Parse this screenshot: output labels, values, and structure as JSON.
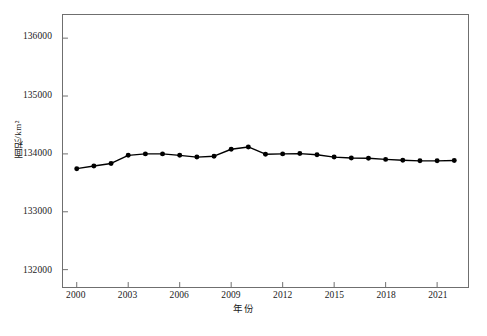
{
  "chart_data": {
    "type": "line",
    "title": "",
    "subtitle": "",
    "xlabel": "年份",
    "ylabel": "面积/km²",
    "xlim": [
      1999.2,
      2022.8
    ],
    "ylim": [
      131700,
      136400
    ],
    "grid": false,
    "legend": "none",
    "marker": "filled-circle",
    "line_color": "#000000",
    "marker_color": "#000000",
    "x_ticks": [
      2000,
      2003,
      2006,
      2009,
      2012,
      2015,
      2018,
      2021
    ],
    "x_tick_labels": [
      "2000",
      "2003",
      "2006",
      "2009",
      "2012",
      "2015",
      "2018",
      "2021"
    ],
    "y_ticks": [
      132000,
      133000,
      134000,
      135000,
      136000
    ],
    "y_tick_labels": [
      "132000",
      "133000",
      "134000",
      "135000",
      "136000"
    ],
    "x": [
      2000,
      2001,
      2002,
      2003,
      2004,
      2005,
      2006,
      2007,
      2008,
      2009,
      2010,
      2011,
      2012,
      2013,
      2014,
      2015,
      2016,
      2017,
      2018,
      2019,
      2020,
      2021,
      2022
    ],
    "values": [
      133745,
      133790,
      133835,
      133975,
      134000,
      134000,
      133975,
      133945,
      133960,
      134080,
      134120,
      133995,
      134000,
      134005,
      133985,
      133945,
      133930,
      133925,
      133905,
      133890,
      133880,
      133880,
      133885
    ],
    "series": [
      {
        "name": "面积",
        "values": [
          133745,
          133790,
          133835,
          133975,
          134000,
          134000,
          133975,
          133945,
          133960,
          134080,
          134120,
          133995,
          134000,
          134005,
          133985,
          133945,
          133930,
          133925,
          133905,
          133890,
          133880,
          133880,
          133885
        ]
      }
    ]
  }
}
